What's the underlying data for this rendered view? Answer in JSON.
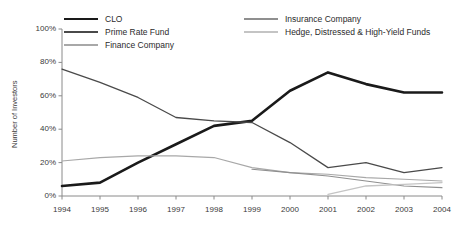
{
  "chart_data": {
    "type": "line",
    "title": "",
    "xlabel": "",
    "ylabel": "Number of Investors",
    "categories": [
      "1994",
      "1995",
      "1996",
      "1997",
      "1998",
      "1999",
      "2000",
      "2001",
      "2002",
      "2003",
      "2004"
    ],
    "x": [
      1994,
      1995,
      1996,
      1997,
      1998,
      1999,
      2000,
      2001,
      2002,
      2003,
      2004
    ],
    "ylim": [
      0,
      100
    ],
    "yticks": [
      "0%",
      "20%",
      "40%",
      "60%",
      "80%",
      "100%"
    ],
    "ytick_values": [
      0,
      20,
      40,
      60,
      80,
      100
    ],
    "grid": false,
    "legend_position": "top",
    "units": "percent",
    "series": [
      {
        "name": "CLO",
        "color": "#1a1a1a",
        "width": 2.6,
        "values": [
          6,
          8,
          20,
          31,
          42,
          45,
          63,
          74,
          67,
          62,
          62
        ]
      },
      {
        "name": "Prime Rate Fund",
        "color": "#4a4a4a",
        "width": 1.3,
        "values": [
          76,
          68,
          59,
          47,
          45,
          44,
          32,
          17,
          20,
          14,
          17
        ]
      },
      {
        "name": "Finance Company",
        "color": "#a8a8a8",
        "width": 1.1,
        "values": [
          21,
          23,
          24,
          24,
          23,
          17,
          14,
          13,
          11,
          10,
          9
        ]
      },
      {
        "name": "Insurance Company",
        "color": "#8f8f8f",
        "width": 1.1,
        "values": [
          null,
          null,
          null,
          null,
          null,
          16,
          14,
          12,
          9,
          6,
          5
        ]
      },
      {
        "name": "Hedge, Distressed & High-Yield Funds",
        "color": "#c4c4c4",
        "width": 1.3,
        "values": [
          null,
          null,
          null,
          null,
          null,
          null,
          null,
          1,
          6,
          7,
          8
        ]
      }
    ]
  },
  "legend": {
    "items": [
      {
        "label": "CLO",
        "color": "#1a1a1a",
        "width": 2.6,
        "col": 0,
        "row": 0
      },
      {
        "label": "Prime Rate Fund",
        "color": "#4a4a4a",
        "width": 1.6,
        "col": 0,
        "row": 1
      },
      {
        "label": "Finance Company",
        "color": "#a8a8a8",
        "width": 1.1,
        "col": 0,
        "row": 2
      },
      {
        "label": "Insurance Company",
        "color": "#8f8f8f",
        "width": 1.1,
        "col": 1,
        "row": 0
      },
      {
        "label": "Hedge, Distressed & High-Yield Funds",
        "color": "#c4c4c4",
        "width": 1.4,
        "col": 1,
        "row": 1
      }
    ]
  },
  "axes": {
    "y_label": "Number of Investors",
    "axis_color": "#8a8a8a"
  }
}
